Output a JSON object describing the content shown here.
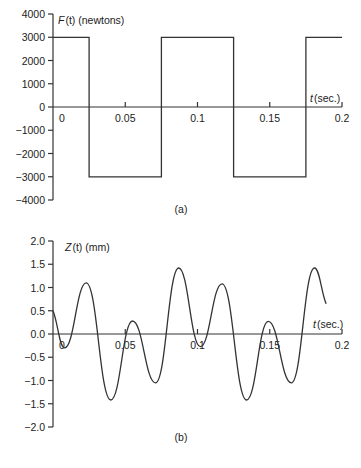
{
  "chart_data": [
    {
      "type": "line",
      "panel": "(a)",
      "title": "",
      "caption": "(a)",
      "ylabel": "F(t) (newtons)",
      "ylabel_italic": "F",
      "ylabel_rest": "(t) (newtons)",
      "xlabel": "t (sec.)",
      "xlabel_italic": "t",
      "xlabel_rest": "(sec.)",
      "xlim": [
        0,
        0.2
      ],
      "ylim": [
        -4000,
        4000
      ],
      "yticks": [
        4000,
        3000,
        2000,
        1000,
        0,
        -1000,
        -2000,
        -3000,
        -4000
      ],
      "ytick_labels": [
        "4000",
        "3000",
        "2000",
        "1000",
        "0",
        "−1000",
        "−2000",
        "−3000",
        "−4000"
      ],
      "xticks": [
        0,
        0.05,
        0.1,
        0.15,
        0.2
      ],
      "xtick_labels": [
        "0",
        "0.05",
        "0.1",
        "0.15",
        "0.2"
      ],
      "grid": false,
      "description": "Square wave of amplitude 3000 N, period 0.1 s",
      "x": [
        0,
        0.025,
        0.025,
        0.075,
        0.075,
        0.125,
        0.125,
        0.175,
        0.175,
        0.2
      ],
      "values": [
        3000,
        3000,
        -3000,
        -3000,
        3000,
        3000,
        -3000,
        -3000,
        3000,
        3000
      ]
    },
    {
      "type": "line",
      "panel": "(b)",
      "title": "",
      "caption": "(b)",
      "ylabel": "Z(t) (mm)",
      "ylabel_italic": "Z",
      "ylabel_rest": "(t) (mm)",
      "xlabel": "t (sec.)",
      "xlabel_italic": "t",
      "xlabel_rest": "(sec.)",
      "xlim": [
        0,
        0.2
      ],
      "ylim": [
        -2.0,
        2.0
      ],
      "yticks": [
        2.0,
        1.5,
        1.0,
        0.5,
        0.0,
        -0.5,
        -1.0,
        -1.5,
        -2.0
      ],
      "ytick_labels": [
        "2.0",
        "1.5",
        "1.0",
        "0.5",
        "0.0",
        "−0.5",
        "−1.0",
        "−1.5",
        "−2.0"
      ],
      "xticks": [
        0,
        0.05,
        0.1,
        0.15,
        0.2
      ],
      "xtick_labels": [
        "0",
        "0.05",
        "0.1",
        "0.15",
        "0.2"
      ],
      "grid": false,
      "description": "Oscillatory displacement response to the square-wave force",
      "x": [
        0,
        0.008,
        0.023,
        0.04,
        0.055,
        0.071,
        0.087,
        0.102,
        0.117,
        0.134,
        0.149,
        0.165,
        0.181,
        0.189
      ],
      "values": [
        0.5,
        -0.3,
        1.1,
        -1.42,
        0.28,
        -1.05,
        1.42,
        -0.27,
        1.08,
        -1.42,
        0.27,
        -1.05,
        1.42,
        0.65
      ]
    }
  ]
}
